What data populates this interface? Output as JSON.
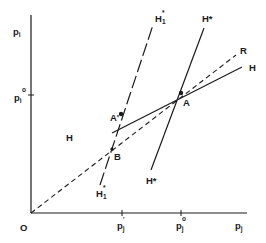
{
  "diagram": {
    "type": "economic-line-diagram",
    "colors": {
      "ink": "#1a1a1a",
      "background": "#ffffff"
    },
    "axes": {
      "origin_label": "O",
      "y_axis": {
        "label_main": "p",
        "label_sub": "i"
      },
      "x_axis": {
        "label_main": "p",
        "label_sub": "j"
      },
      "y_ticks": [
        {
          "label_main": "p",
          "label_sub": "i",
          "label_sup": "o"
        }
      ],
      "x_ticks": [
        {
          "label_main": "p",
          "label_sub": "j",
          "label_sup": "'"
        },
        {
          "label_main": "p",
          "label_sub": "j",
          "label_sup": "o"
        }
      ]
    },
    "lines": [
      {
        "id": "H",
        "style": "solid",
        "labels": [
          "H",
          "H"
        ]
      },
      {
        "id": "H*",
        "style": "solid",
        "labels": [
          "H*",
          "H*"
        ]
      },
      {
        "id": "H1*",
        "style": "long-dash",
        "label_main": "H",
        "label_sub": "1",
        "label_sup": "*"
      },
      {
        "id": "R",
        "style": "dashed",
        "label": "R"
      }
    ],
    "points": [
      {
        "label": "A"
      },
      {
        "label": "A'"
      },
      {
        "label": "B"
      }
    ]
  }
}
